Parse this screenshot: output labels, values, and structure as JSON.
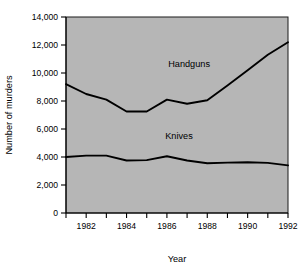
{
  "chart_data": {
    "type": "line",
    "title": "",
    "xlabel": "Year",
    "ylabel": "Number of murders",
    "x": [
      1981,
      1982,
      1983,
      1984,
      1985,
      1986,
      1987,
      1988,
      1989,
      1990,
      1991,
      1992
    ],
    "xlim": [
      1981,
      1992
    ],
    "ylim": [
      0,
      14000
    ],
    "grid": false,
    "legend_position": "inline-annotations",
    "x_tick_values": [
      1981,
      1982,
      1983,
      1984,
      1985,
      1986,
      1987,
      1988,
      1989,
      1990,
      1991,
      1992
    ],
    "x_tick_labels": [
      "",
      "1982",
      "",
      "1984",
      "",
      "1986",
      "",
      "1988",
      "",
      "1990",
      "",
      "1992"
    ],
    "y_tick_values": [
      0,
      2000,
      4000,
      6000,
      8000,
      10000,
      12000,
      14000
    ],
    "y_tick_labels": [
      "0",
      "2,000",
      "4,000",
      "6,000",
      "8,000",
      "10,000",
      "12,000",
      "14,000"
    ],
    "series": [
      {
        "name": "Handguns",
        "values": [
          9200,
          8500,
          8100,
          7250,
          7250,
          8100,
          7800,
          8050,
          9100,
          10200,
          11300,
          12200
        ]
      },
      {
        "name": "Knives",
        "values": [
          4000,
          4100,
          4100,
          3750,
          3780,
          4050,
          3750,
          3550,
          3600,
          3620,
          3580,
          3400
        ]
      }
    ],
    "annotations": [
      {
        "text": "Handguns",
        "x": 1987.1,
        "y": 10450
      },
      {
        "text": "Knives",
        "x": 1986.6,
        "y": 5300
      }
    ],
    "colors": {
      "plot_background": "#b6b6b6",
      "line": "#000000",
      "text": "#000000",
      "page_background": "#ffffff"
    }
  }
}
